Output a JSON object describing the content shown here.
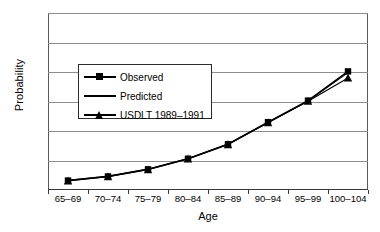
{
  "chart_data": {
    "type": "line",
    "title": "",
    "xlabel": "Age",
    "ylabel": "Probability",
    "categories": [
      "65–69",
      "70–74",
      "75–79",
      "80–84",
      "85–89",
      "90–94",
      "95–99",
      "100–104"
    ],
    "ylim": [
      0.0,
      0.6
    ],
    "ytick_labels": [
      "0.00",
      "0.10",
      "0.20",
      "0.30",
      "0.40",
      "0.50",
      "0.60"
    ],
    "ytick_values": [
      0.0,
      0.1,
      0.2,
      0.3,
      0.4,
      0.5,
      0.6
    ],
    "grid": "horizontal",
    "legend_position": "center-left-inside",
    "series": [
      {
        "name": "Observed",
        "marker": "square",
        "values": [
          0.032,
          0.046,
          0.07,
          0.106,
          0.155,
          0.23,
          0.303,
          0.402
        ]
      },
      {
        "name": "Predicted",
        "marker": "none",
        "values": [
          0.033,
          0.047,
          0.071,
          0.107,
          0.156,
          0.229,
          0.302,
          0.398
        ]
      },
      {
        "name": "USDLT 1989–1991",
        "marker": "triangle",
        "values": [
          0.031,
          0.045,
          0.069,
          0.105,
          0.154,
          0.228,
          0.301,
          0.38
        ]
      }
    ]
  },
  "legend": {
    "items": [
      {
        "label": "Observed"
      },
      {
        "label": "Predicted"
      },
      {
        "label": "USDLT 1989–1991"
      }
    ]
  },
  "colors": {
    "series": "#000000",
    "grid": "#8d8d8d",
    "axis": "#3a3a3a",
    "background": "#ffffff"
  }
}
